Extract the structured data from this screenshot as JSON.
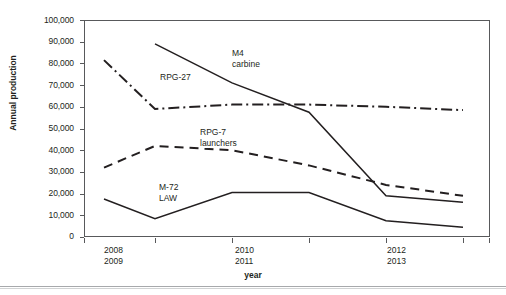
{
  "chart_data": {
    "type": "line",
    "title": "",
    "xlabel": "year",
    "ylabel": "Annual production",
    "ylim": [
      0,
      100000
    ],
    "ytick_labels": [
      "100,000",
      "90,000",
      "80,000",
      "70,000",
      "60,000",
      "50,000",
      "40,000",
      "30,000",
      "20,000",
      "10,000",
      "0"
    ],
    "ytick_values": [
      100000,
      90000,
      80000,
      70000,
      60000,
      50000,
      40000,
      30000,
      20000,
      10000,
      0
    ],
    "xtick_labels": [
      {
        "top": "2008",
        "bottom": "2009"
      },
      {
        "top": "2010",
        "bottom": "2011"
      },
      {
        "top": "2012",
        "bottom": "2013"
      }
    ],
    "x": [
      2008,
      2009,
      2010,
      2011,
      2012,
      2013
    ],
    "grid": false,
    "legend_position": "inline-annotations",
    "series": [
      {
        "name": "M4 carbine",
        "style": "solid",
        "annotation": {
          "line1": "M4",
          "line2": "carbine"
        },
        "x": [
          2009,
          2010,
          2011,
          2012,
          2013
        ],
        "values": [
          89000,
          71000,
          57500,
          19000,
          16000
        ]
      },
      {
        "name": "RPG-27",
        "style": "dash-dot",
        "annotation": {
          "line1": "RPG-27",
          "line2": ""
        },
        "x": [
          2008,
          2009,
          2010,
          2011,
          2012,
          2013
        ],
        "values": [
          81500,
          59000,
          61000,
          61000,
          60000,
          58500
        ]
      },
      {
        "name": "RPG-7 launchers",
        "style": "dashed",
        "annotation": {
          "line1": "RPG-7",
          "line2": "launchers"
        },
        "x": [
          2008,
          2009,
          2010,
          2011,
          2012,
          2013
        ],
        "values": [
          32000,
          42000,
          40000,
          33000,
          24000,
          19000
        ]
      },
      {
        "name": "M-72 LAW",
        "style": "solid",
        "annotation": {
          "line1": "M-72",
          "line2": "LAW"
        },
        "x": [
          2008,
          2009,
          2010,
          2011,
          2012,
          2013
        ],
        "values": [
          17500,
          8500,
          20500,
          20500,
          7500,
          4500
        ]
      }
    ]
  },
  "colors": {
    "line": "#231f20",
    "frame": "#58595b",
    "text": "#231f20",
    "rule": "#a7a9ac"
  }
}
